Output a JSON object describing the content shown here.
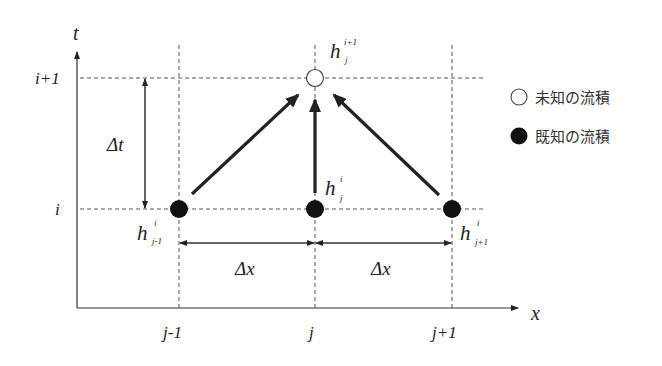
{
  "diagram": {
    "axes": {
      "t_label": "t",
      "x_label": "x"
    },
    "row_labels": {
      "upper": "i+1",
      "lower": "i"
    },
    "col_labels": {
      "left": "j-1",
      "center": "j",
      "right": "j+1"
    },
    "deltas": {
      "dt": "Δt",
      "dx_left": "Δx",
      "dx_right": "Δx"
    },
    "nodes": {
      "top": {
        "base": "h",
        "sup": "i+1",
        "sub": "j"
      },
      "left": {
        "base": "h",
        "sup": "i",
        "sub": "j-1"
      },
      "center": {
        "base": "h",
        "sup": "i",
        "sub": "j"
      },
      "right": {
        "base": "h",
        "sup": "i",
        "sub": "j+1"
      }
    },
    "legend": [
      {
        "symbol": "open-circle",
        "label": "未知の流積"
      },
      {
        "symbol": "filled-circle",
        "label": "既知の流積"
      }
    ]
  }
}
